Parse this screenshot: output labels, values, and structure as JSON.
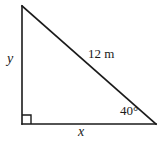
{
  "figure": {
    "kind": "right-triangle-diagram",
    "background_color": "#ffffff",
    "stroke_color": "#1a1a1a",
    "labels": {
      "vertical_leg": "y",
      "horizontal_leg": "x",
      "hypotenuse": "12 m",
      "angle": "40°"
    },
    "markers": {
      "right_angle": "right-angle-square"
    },
    "geometry": {
      "apex": [
        22,
        6
      ],
      "bottom_left": [
        22,
        124
      ],
      "bottom_right": [
        156,
        124
      ],
      "right_angle_box_size": 9
    }
  }
}
